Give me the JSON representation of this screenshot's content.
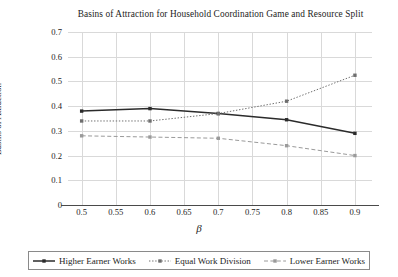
{
  "chart_data": {
    "type": "line",
    "title": "Basins of Attraction for Household Coordination Game and Resource Split",
    "xlabel": "β",
    "ylabel": "Basins of Attraction",
    "x": [
      0.5,
      0.6,
      0.7,
      0.8,
      0.9
    ],
    "xlim": [
      0.48,
      0.925
    ],
    "ylim": [
      0,
      0.7
    ],
    "xticks": [
      0.5,
      0.55,
      0.6,
      0.65,
      0.7,
      0.75,
      0.8,
      0.85,
      0.9
    ],
    "xtick_labels": [
      "0.5",
      "0.55",
      "0.6",
      "0.65",
      "0.7",
      "0.75",
      "0.8",
      "0.85",
      "0.9"
    ],
    "yticks": [
      0,
      0.1,
      0.2,
      0.3,
      0.4,
      0.5,
      0.6,
      0.7
    ],
    "ytick_labels": [
      "0",
      "0.1",
      "0.2",
      "0.3",
      "0.4",
      "0.5",
      "0.6",
      "0.7"
    ],
    "grid": true,
    "legend_position": "bottom",
    "series": [
      {
        "name": "Higher Earner Works",
        "values": [
          0.38,
          0.39,
          0.37,
          0.345,
          0.29
        ],
        "style": "solid",
        "color": "#2b2b2b",
        "marker": "square"
      },
      {
        "name": "Equal Work Division",
        "values": [
          0.34,
          0.34,
          0.37,
          0.42,
          0.525
        ],
        "style": "dotted",
        "color": "#6e6e6e",
        "marker": "square"
      },
      {
        "name": "Lower Earner Works",
        "values": [
          0.28,
          0.275,
          0.27,
          0.24,
          0.2
        ],
        "style": "dashed",
        "color": "#9a9a9a",
        "marker": "square"
      }
    ],
    "grid_color": "#d9d9d9",
    "axis_color": "#4a4a4a",
    "background": "#ffffff"
  }
}
